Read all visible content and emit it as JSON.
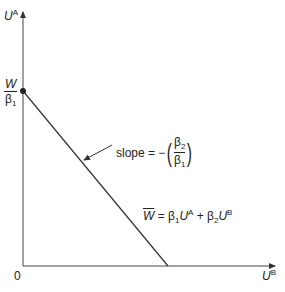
{
  "diagram": {
    "y_axis": {
      "label_base": "U",
      "label_sup": "A"
    },
    "x_axis": {
      "label_base": "U",
      "label_sup": "B"
    },
    "origin_label": "0",
    "intercept": {
      "numerator": "W",
      "denominator_base": "β",
      "denominator_sub": "1"
    },
    "slope_annotation": {
      "text": "slope = −",
      "frac_num_base": "β",
      "frac_num_sub": "2",
      "frac_den_base": "β",
      "frac_den_sub": "1",
      "open_paren": "(",
      "close_paren": ")"
    },
    "equation": {
      "lhs": "W",
      "eq": " = ",
      "b1": "β",
      "b1_sub": "1",
      "u1": "U",
      "u1_sup": "A",
      "plus": " + ",
      "b2": "β",
      "b2_sub": "2",
      "u2": "U",
      "u2_sup": "B"
    },
    "line_color": "#333333"
  }
}
